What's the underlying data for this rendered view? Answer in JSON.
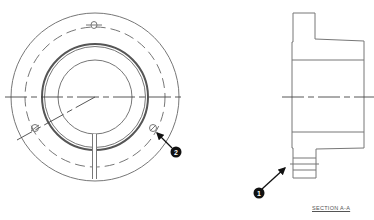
{
  "diagram": {
    "front_view": {
      "center": [
        95,
        97
      ],
      "outer_radius": 84,
      "bolt_circle_radius": 70,
      "hub_radius": 53,
      "bore_radius": 37,
      "bolt_holes": [
        [
          94,
          25
        ],
        [
          35,
          128
        ],
        [
          153,
          128
        ]
      ]
    },
    "section_view": {
      "label": "SECTION A-A"
    },
    "callouts": [
      {
        "number": "1",
        "target": "hub-grooves"
      },
      {
        "number": "2",
        "target": "bolt-hole"
      }
    ],
    "colors": {
      "line": "#777777",
      "callout": "#111111",
      "background": "#ffffff"
    }
  }
}
